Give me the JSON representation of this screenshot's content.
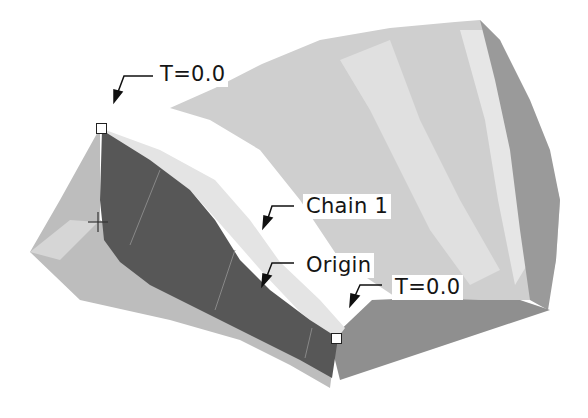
{
  "figure": {
    "labels": {
      "start_param": "T=0.0",
      "chain": "Chain 1",
      "origin": "Origin",
      "end_param": "T=0.0"
    },
    "colors": {
      "background": "#ffffff",
      "surface_light": "#cfcfcf",
      "surface_lighter": "#e2e2e2",
      "surface_mid": "#b3b3b3",
      "surface_dark": "#8e8e8e",
      "selected_face": "#595959",
      "label_text": "#151515"
    },
    "icons": [
      "leader-arrow-icon",
      "vertex-marker-icon",
      "csys-crosshair-icon"
    ]
  }
}
